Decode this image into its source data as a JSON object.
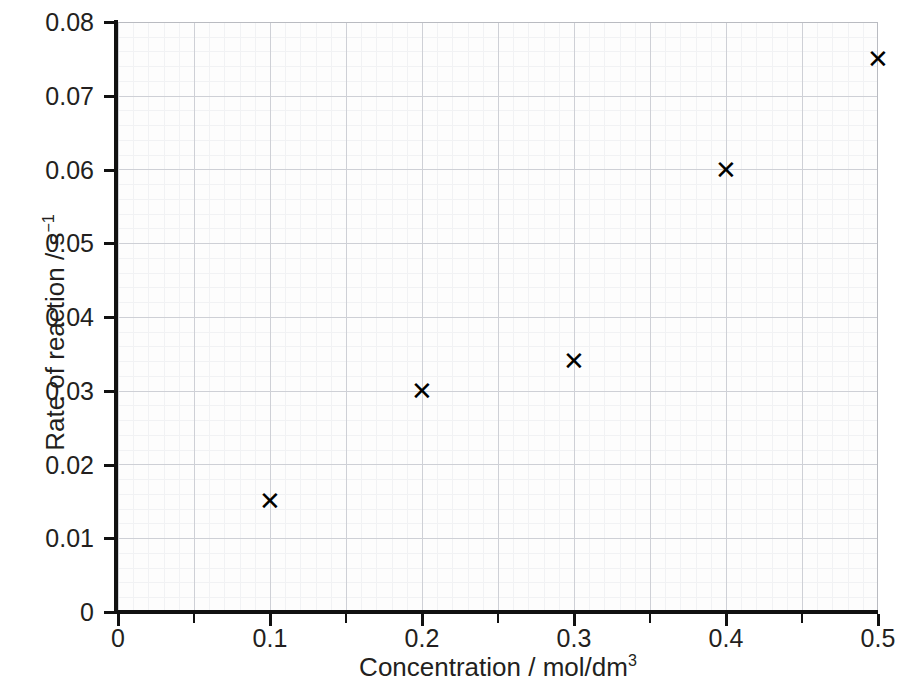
{
  "chart_data": {
    "type": "scatter",
    "title": "",
    "xlabel": "Concentration / mol/dm3",
    "ylabel": "Rate of reaction / s-1",
    "xlim": [
      0,
      0.5
    ],
    "ylim": [
      0,
      0.08
    ],
    "grid": true,
    "legend": "none",
    "marker": "cross",
    "x": [
      0.1,
      0.2,
      0.3,
      0.4,
      0.5
    ],
    "values": [
      0.015,
      0.03,
      0.034,
      0.06,
      0.075
    ],
    "points": [
      {
        "x": 0.1,
        "y": 0.015
      },
      {
        "x": 0.2,
        "y": 0.03
      },
      {
        "x": 0.3,
        "y": 0.034
      },
      {
        "x": 0.4,
        "y": 0.06
      },
      {
        "x": 0.5,
        "y": 0.075
      }
    ],
    "x_tick_labels": [
      "0",
      "0.1",
      "0.2",
      "0.3",
      "0.4",
      "0.5"
    ],
    "x_tick_values": [
      0,
      0.1,
      0.2,
      0.3,
      0.4,
      0.5
    ],
    "x_minor_tick_values": [
      0.05,
      0.15,
      0.25,
      0.35,
      0.45
    ],
    "y_tick_labels": [
      "0",
      "0.01",
      "0.02",
      "0.03",
      "0.04",
      "0.05",
      "0.06",
      "0.07",
      "0.08"
    ],
    "y_tick_values": [
      0,
      0.01,
      0.02,
      0.03,
      0.04,
      0.05,
      0.06,
      0.07,
      0.08
    ]
  },
  "axis_titles": {
    "x_prefix": "Concentration / mol/dm",
    "x_superscript": "3",
    "y_prefix": "Rate of reaction / s",
    "y_superscript": "−1"
  },
  "colors": {
    "marker": "#000000",
    "axis": "#111111",
    "grid_major": "#c9cbd1",
    "grid_minor": "#e9eaee",
    "background": "#ffffff",
    "plot_background": "#fdfdfd",
    "text": "#231f20"
  }
}
